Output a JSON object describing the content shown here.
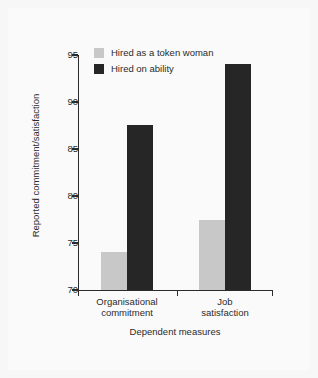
{
  "chart_data": {
    "type": "bar",
    "title": "",
    "subtitle": "",
    "xlabel": "Dependent measures",
    "ylabel": "Reported commitment/satisfaction",
    "categories": [
      "Organisational commitment",
      "Job satisfaction"
    ],
    "category_lines": [
      [
        "Organisational",
        "commitment"
      ],
      [
        "Job",
        "satisfaction"
      ]
    ],
    "series": [
      {
        "name": "Hired as a token woman",
        "color": "#c8c8c8",
        "values": [
          74.0,
          77.5
        ]
      },
      {
        "name": "Hired on ability",
        "color": "#262626",
        "values": [
          87.6,
          94.0
        ]
      }
    ],
    "ylim": [
      70,
      95
    ],
    "yticks": [
      70,
      75,
      80,
      85,
      90,
      95
    ],
    "ytick_labels": [
      "70",
      "75",
      "80",
      "85",
      "90",
      "95"
    ],
    "grid": false,
    "legend_position": "top-left-inside",
    "background_color": "#fafafa",
    "axis_color": "#2b2b2b"
  },
  "legend": {
    "entries": [
      {
        "label": "Hired as a token woman",
        "swatch": "token"
      },
      {
        "label": "Hired on ability",
        "swatch": "ability"
      }
    ]
  }
}
